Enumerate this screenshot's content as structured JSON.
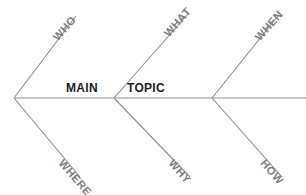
{
  "diagram": {
    "type": "fishbone",
    "alt_name": "Ishikawa cause-and-effect diagram",
    "background_color": "#ffffff",
    "line_color": "#8c8c91",
    "label_color": "#7b7b7f",
    "topic_color": "#1d1d1f",
    "topic": {
      "full_text": "MAIN TOPIC",
      "word_main": "MAIN",
      "word_tail": "TOPIC"
    },
    "spine": {
      "start_x": 14,
      "start_y": 98,
      "end_x": 306,
      "end_y": 98
    },
    "joints": [
      {
        "name": "head-joint",
        "x": 14,
        "y": 98
      },
      {
        "name": "middle-joint",
        "x": 114,
        "y": 98
      },
      {
        "name": "tail-joint",
        "x": 212,
        "y": 98
      }
    ],
    "branches": [
      {
        "id": "who",
        "label": "WHO",
        "position": "upper",
        "joint_x": 14,
        "joint_y": 98,
        "tip_x": 76,
        "tip_y": 16
      },
      {
        "id": "what",
        "label": "WHAT",
        "position": "upper",
        "joint_x": 114,
        "joint_y": 98,
        "tip_x": 188,
        "tip_y": 14
      },
      {
        "id": "when",
        "label": "WHEN",
        "position": "upper",
        "joint_x": 212,
        "joint_y": 98,
        "tip_x": 278,
        "tip_y": 16
      },
      {
        "id": "where",
        "label": "WHERE",
        "position": "lower",
        "joint_x": 14,
        "joint_y": 98,
        "tip_x": 80,
        "tip_y": 177
      },
      {
        "id": "why",
        "label": "WHY",
        "position": "lower",
        "joint_x": 114,
        "joint_y": 98,
        "tip_x": 190,
        "tip_y": 177
      },
      {
        "id": "how",
        "label": "HOW",
        "position": "lower",
        "joint_x": 212,
        "joint_y": 98,
        "tip_x": 282,
        "tip_y": 177
      }
    ]
  }
}
